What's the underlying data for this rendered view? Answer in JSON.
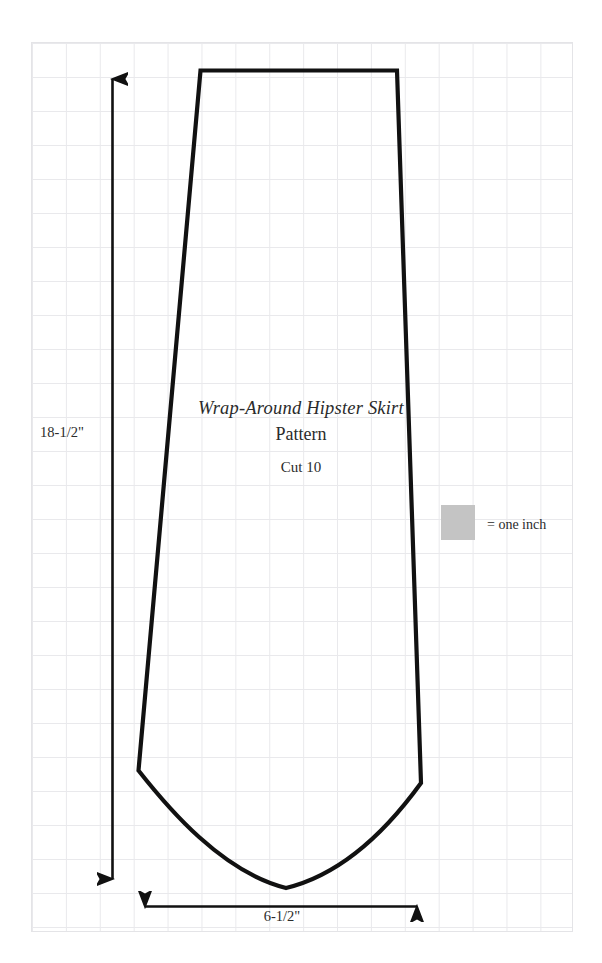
{
  "document": {
    "type": "sewing-pattern-diagram",
    "title": "Wrap-Around Hipster Skirt",
    "subtitle": "Pattern",
    "cut_instruction": "Cut 10"
  },
  "measurements": {
    "height_label": "18-1/2\"",
    "width_label": "6-1/2\""
  },
  "legend": {
    "label": "= one inch",
    "swatch_color": "#c4c4c4"
  },
  "colors": {
    "outline": "#111111",
    "grid_line": "#e9e9ec",
    "background": "#ffffff",
    "text": "#2b2b2b"
  },
  "geometry": {
    "grid_cell_px": 34,
    "sheet": {
      "x": 31,
      "y": 42,
      "width": 542,
      "height": 890
    },
    "piece_outline": {
      "top_left": [
        200,
        70
      ],
      "top_right": [
        397,
        70
      ],
      "hem_right": [
        421,
        783
      ],
      "hem_left": [
        138,
        770
      ]
    },
    "vertical_arrow": {
      "x": 112,
      "y_top": 72,
      "y_bottom": 886
    },
    "horizontal_arrow": {
      "y": 906,
      "x_left": 138,
      "x_right": 424
    }
  }
}
